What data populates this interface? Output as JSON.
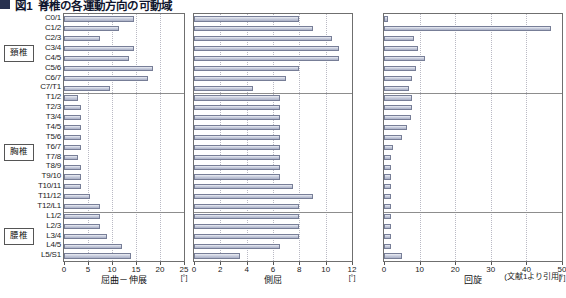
{
  "figure": {
    "number": "図1",
    "title": "脊椎の各運動方向の可動域",
    "source_note": "(文献1より引用)"
  },
  "groups": [
    {
      "label": "頚椎",
      "start": 0,
      "end": 8
    },
    {
      "label": "胸椎",
      "start": 8,
      "end": 20
    },
    {
      "label": "腰椎",
      "start": 20,
      "end": 25
    }
  ],
  "levels": [
    "C0/1",
    "C1/2",
    "C2/3",
    "C3/4",
    "C4/5",
    "C5/6",
    "C6/7",
    "C7/T1",
    "T1/2",
    "T2/3",
    "T3/4",
    "T4/5",
    "T5/6",
    "T6/7",
    "T7/8",
    "T8/9",
    "T9/10",
    "T10/11",
    "T11/12",
    "T12/L1",
    "L1/2",
    "L2/3",
    "L3/4",
    "L4/5",
    "L5/S1"
  ],
  "chart_data": [
    {
      "type": "bar",
      "orientation": "horizontal",
      "title": "屈曲－伸展",
      "xlabel": "屈曲－伸展",
      "unit": "[°]",
      "ylabel": "",
      "xlim": [
        0,
        25
      ],
      "xticks": [
        0,
        5,
        10,
        15,
        20,
        25
      ],
      "grid": true,
      "categories": [
        "C0/1",
        "C1/2",
        "C2/3",
        "C3/4",
        "C4/5",
        "C5/6",
        "C6/7",
        "C7/T1",
        "T1/2",
        "T2/3",
        "T3/4",
        "T4/5",
        "T5/6",
        "T6/7",
        "T7/8",
        "T8/9",
        "T9/10",
        "T10/11",
        "T11/12",
        "T12/L1",
        "L1/2",
        "L2/3",
        "L3/4",
        "L4/5",
        "L5/S1"
      ],
      "values": [
        14.5,
        11.5,
        7.5,
        14.5,
        13.5,
        18.5,
        17.5,
        9.5,
        3.0,
        3.5,
        3.5,
        3.5,
        3.5,
        3.5,
        3.0,
        3.5,
        3.5,
        3.5,
        5.5,
        7.5,
        7.5,
        7.5,
        9.0,
        12.0,
        14.0
      ]
    },
    {
      "type": "bar",
      "orientation": "horizontal",
      "title": "側屈",
      "xlabel": "側屈",
      "unit": "[°]",
      "ylabel": "",
      "xlim": [
        0,
        12
      ],
      "xticks": [
        0,
        2,
        4,
        6,
        8,
        10,
        12
      ],
      "grid": true,
      "categories": [
        "C0/1",
        "C1/2",
        "C2/3",
        "C3/4",
        "C4/5",
        "C5/6",
        "C6/7",
        "C7/T1",
        "T1/2",
        "T2/3",
        "T3/4",
        "T4/5",
        "T5/6",
        "T6/7",
        "T7/8",
        "T8/9",
        "T9/10",
        "T10/11",
        "T11/12",
        "T12/L1",
        "L1/2",
        "L2/3",
        "L3/4",
        "L4/5",
        "L5/S1"
      ],
      "values": [
        8.0,
        9.0,
        10.5,
        11.0,
        11.0,
        8.0,
        7.0,
        4.5,
        6.5,
        6.5,
        6.5,
        6.5,
        6.5,
        6.5,
        6.5,
        6.5,
        6.5,
        7.5,
        9.0,
        8.0,
        8.0,
        8.0,
        8.0,
        6.5,
        3.5
      ]
    },
    {
      "type": "bar",
      "orientation": "horizontal",
      "title": "回旋",
      "xlabel": "回旋",
      "unit": "[°]",
      "ylabel": "",
      "xlim": [
        0,
        50
      ],
      "xticks": [
        0,
        10,
        20,
        30,
        40,
        50
      ],
      "grid": true,
      "categories": [
        "C0/1",
        "C1/2",
        "C2/3",
        "C3/4",
        "C4/5",
        "C5/6",
        "C6/7",
        "C7/T1",
        "T1/2",
        "T2/3",
        "T3/4",
        "T4/5",
        "T5/6",
        "T6/7",
        "T7/8",
        "T8/9",
        "T9/10",
        "T10/11",
        "T11/12",
        "T12/L1",
        "L1/2",
        "L2/3",
        "L3/4",
        "L4/5",
        "L5/S1"
      ],
      "values": [
        1.0,
        47.0,
        8.5,
        9.5,
        11.5,
        9.0,
        8.0,
        7.0,
        8.0,
        8.0,
        7.5,
        6.5,
        5.0,
        2.5,
        2.0,
        2.0,
        2.0,
        2.0,
        2.0,
        2.0,
        2.0,
        2.0,
        2.0,
        2.0,
        5.0
      ]
    }
  ]
}
